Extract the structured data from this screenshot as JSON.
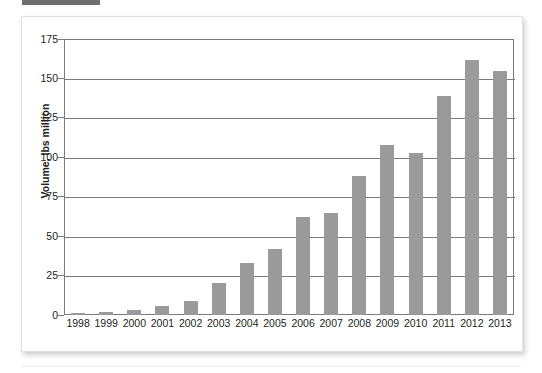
{
  "figure": {
    "top_fragment_label": "",
    "panel_name": "chart-panel"
  },
  "chart_data": {
    "type": "bar",
    "title": "",
    "xlabel": "",
    "ylabel": "Volume, lbs million",
    "categories": [
      "1998",
      "1999",
      "2000",
      "2001",
      "2002",
      "2003",
      "2004",
      "2005",
      "2006",
      "2007",
      "2008",
      "2009",
      "2010",
      "2011",
      "2012",
      "2013"
    ],
    "values": [
      1,
      2,
      3,
      6,
      9,
      20,
      33,
      42,
      62,
      65,
      88,
      108,
      103,
      139,
      162,
      155
    ],
    "ylim": [
      0,
      175
    ],
    "yticks": [
      0,
      25,
      50,
      75,
      100,
      125,
      150,
      175
    ],
    "ytick_labels": [
      "0",
      "25",
      "50",
      "75",
      "100",
      "125",
      "150",
      "175"
    ],
    "grid": true,
    "legend": false,
    "bar_color": "#9a9a9a",
    "axis_color": "#7b7b7b",
    "text_color": "#231f20"
  }
}
